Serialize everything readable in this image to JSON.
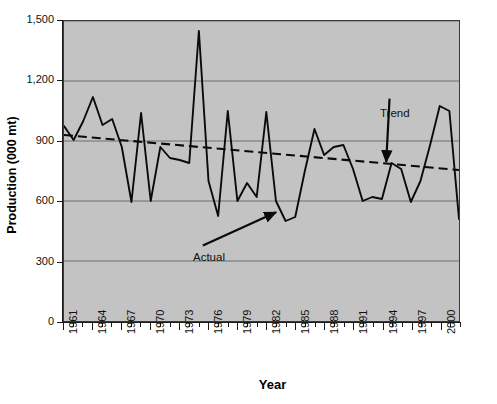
{
  "chart_data": {
    "type": "line",
    "title": "",
    "xlabel": "Year",
    "ylabel": "Production (000 mt)",
    "xlim": [
      1961,
      2002
    ],
    "ylim": [
      0,
      1500
    ],
    "y_ticks": [
      0,
      300,
      600,
      900,
      1200,
      1500
    ],
    "y_tick_labels": [
      "0",
      "300",
      "600",
      "900",
      "1,200",
      "1,500"
    ],
    "x_tick_labels": [
      "1961",
      "1964",
      "1967",
      "1970",
      "1973",
      "1976",
      "1979",
      "1982",
      "1985",
      "1988",
      "1991",
      "1994",
      "1997",
      "2000"
    ],
    "x_tick_years": [
      1961,
      1964,
      1967,
      1970,
      1973,
      1976,
      1979,
      1982,
      1985,
      1988,
      1991,
      1994,
      1997,
      2000
    ],
    "x_minor_tick_step": 1,
    "grid": "horizontal",
    "grid_color": "#6e6e6e",
    "plot_background": "#c3c3c3",
    "legend": "none",
    "series": [
      {
        "name": "Actual",
        "style": "solid",
        "color": "#000000",
        "x": [
          1961,
          1962,
          1963,
          1964,
          1965,
          1966,
          1967,
          1968,
          1969,
          1970,
          1971,
          1972,
          1973,
          1974,
          1975,
          1976,
          1977,
          1978,
          1979,
          1980,
          1981,
          1982,
          1983,
          1984,
          1985,
          1986,
          1987,
          1988,
          1989,
          1990,
          1991,
          1992,
          1993,
          1994,
          1995,
          1996,
          1997,
          1998,
          1999,
          2000,
          2001,
          2002
        ],
        "values": [
          975,
          905,
          1000,
          1120,
          980,
          1010,
          870,
          595,
          1040,
          600,
          870,
          815,
          805,
          790,
          1450,
          700,
          525,
          1050,
          600,
          690,
          620,
          1045,
          600,
          500,
          520,
          750,
          960,
          830,
          870,
          880,
          760,
          600,
          620,
          610,
          790,
          760,
          595,
          700,
          880,
          1075,
          1050,
          510
        ]
      },
      {
        "name": "Trend",
        "style": "dashed",
        "color": "#000000",
        "x": [
          1961,
          2002
        ],
        "values": [
          930,
          755
        ]
      }
    ],
    "annotations": [
      {
        "label": "Actual",
        "text_x": 1974,
        "text_y": 370,
        "arrow_to_x": 1983,
        "arrow_to_y": 545,
        "arrow_direction": "up-right"
      },
      {
        "label": "Trend",
        "text_x": 1994,
        "text_y": 1040,
        "arrow_to_x": 1995,
        "arrow_to_y": 795,
        "arrow_direction": "down-left"
      }
    ]
  }
}
